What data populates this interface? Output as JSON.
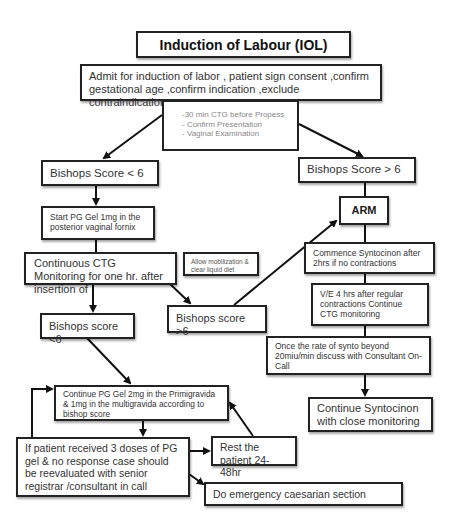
{
  "title": "Induction of Labour (IOL)",
  "nodes": {
    "admit": "Admit for induction of labor , patient sign consent ,confirm gestational age ,confirm indication ,exclude contraindication",
    "pre_checks": [
      "-30 min CTG before Propess",
      "- Confirm Presentation",
      "- Vaginal Examination"
    ],
    "bishops_lt6_top": "Bishops Score < 6",
    "bishops_gt6_right": "Bishops Score > 6",
    "arm": "ARM",
    "start_pg_gel": "Start PG Gel 1mg in the posterior vaginal fornix",
    "continuous_ctg": "Continuous CTG Monitoring for one hr. after insertion of",
    "allow_mobilization": "Allow mobilization & clear liquid diet",
    "commence_syntocinon": "Commence Syntocinon after 2hrs if no contractions",
    "bishops_lt6_lower": "Bishops score <6",
    "bishops_gt6_mid": "Bishops score >6",
    "ve_4hrs": "V/E 4 hrs after regular contractions Continue CTG monitoring",
    "synto_rate": "Once the rate of synto beyond 20miu/min discuss with Consultant On-Call",
    "continue_pg_gel_2mg": "Continue PG Gel 2mg in the  Primigravida & 1mg in the multigravida according to bishop score",
    "continue_syntocinon": "Continue Syntocinon with close monitoring",
    "three_doses": "If patient received 3 doses of PG gel & no response case should be reevaluated with senior registrar /consultant in call",
    "rest_patient": "Rest the patient 24-48hr",
    "emergency_cs": "Do emergency caesarian section"
  },
  "colors": {
    "border": "#222222",
    "text": "#333333",
    "muted_text": "#888888",
    "background": "#ffffff"
  }
}
